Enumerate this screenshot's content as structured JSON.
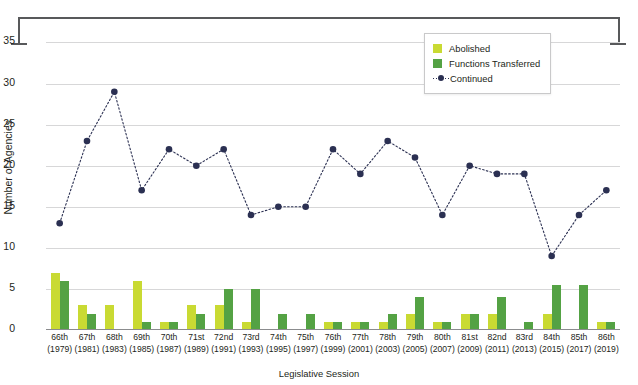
{
  "chart_data": {
    "type": "bar",
    "title": "",
    "xlabel": "Legislative Session",
    "ylabel": "Number of Agencies",
    "ylim": [
      0,
      37
    ],
    "yticks": [
      0,
      5,
      10,
      15,
      20,
      25,
      30,
      35
    ],
    "grid": true,
    "legend_position": "top-right",
    "categories": [
      "66th\n(1979)",
      "67th\n(1981)",
      "68th\n(1983)",
      "69th\n(1985)",
      "70th\n(1987)",
      "71st\n(1989)",
      "72nd\n(1991)",
      "73rd\n(1993)",
      "74th\n(1995)",
      "75th\n(1997)",
      "76th\n(1999)",
      "77th\n(2001)",
      "78th\n(2003)",
      "79th\n(2005)",
      "80th\n(2007)",
      "81st\n(2009)",
      "82nd\n(2011)",
      "83rd\n(2013)",
      "84th\n(2015)",
      "85th\n(2017)",
      "86th\n(2019)"
    ],
    "category_session": [
      "66th",
      "67th",
      "68th",
      "69th",
      "70th",
      "71st",
      "72nd",
      "73rd",
      "74th",
      "75th",
      "76th",
      "77th",
      "78th",
      "79th",
      "80th",
      "81st",
      "82nd",
      "83rd",
      "84th",
      "85th",
      "86th"
    ],
    "category_year": [
      "(1979)",
      "(1981)",
      "(1983)",
      "(1985)",
      "(1987)",
      "(1989)",
      "(1991)",
      "(1993)",
      "(1995)",
      "(1997)",
      "(1999)",
      "(2001)",
      "(2003)",
      "(2005)",
      "(2007)",
      "(2009)",
      "(2011)",
      "(2013)",
      "(2015)",
      "(2017)",
      "(2019)"
    ],
    "series": [
      {
        "name": "Abolished",
        "type": "bar",
        "color": "#c9da33",
        "values": [
          7,
          3,
          3,
          6,
          1,
          3,
          3,
          1,
          0,
          0,
          1,
          1,
          1,
          2,
          1,
          2,
          2,
          0,
          2,
          0,
          1
        ]
      },
      {
        "name": "Functions Transferred",
        "type": "bar",
        "color": "#54a244",
        "values": [
          6,
          2,
          0,
          1,
          1,
          2,
          5,
          5,
          2,
          2,
          1,
          1,
          2,
          4,
          1,
          2,
          4,
          1,
          5.5,
          5.5,
          1
        ]
      },
      {
        "name": "Continued",
        "type": "line",
        "color": "#2b3052",
        "values": [
          13,
          23,
          29,
          17,
          22,
          20,
          22,
          14,
          15,
          15,
          22,
          19,
          23,
          21,
          14,
          20,
          19,
          19,
          9,
          14,
          17
        ]
      }
    ]
  },
  "legend": {
    "items": [
      {
        "label": "Abolished",
        "marker": "square-swatch"
      },
      {
        "label": "Functions Transferred",
        "marker": "square-swatch"
      },
      {
        "label": "Continued",
        "marker": "dotted-line-with-dot"
      }
    ]
  },
  "colors": {
    "abolished": "#c9da33",
    "transferred": "#54a244",
    "continued": "#2b3052",
    "gridline": "#d7d7d8",
    "axis": "#8b8c8e",
    "text": "#231f20"
  }
}
